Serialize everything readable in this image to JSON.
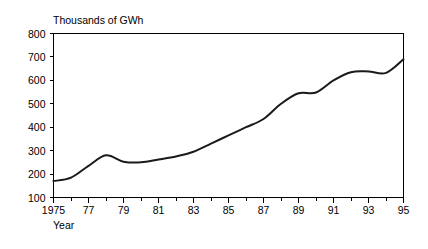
{
  "chart_data": {
    "type": "line",
    "title": "",
    "ylabel": "Thousands of GWh",
    "xlabel": "Year",
    "ylim": [
      100,
      800
    ],
    "xlim": [
      1975,
      1995
    ],
    "grid": false,
    "legend": null,
    "y_ticks": [
      100,
      200,
      300,
      400,
      500,
      600,
      700,
      800
    ],
    "y_tick_labels": [
      "100",
      "200",
      "300",
      "400",
      "500",
      "600",
      "700",
      "800"
    ],
    "x_ticks": [
      1975,
      1977,
      1979,
      1981,
      1983,
      1985,
      1987,
      1989,
      1991,
      1993,
      1995
    ],
    "x_tick_labels": [
      "1975",
      "77",
      "79",
      "81",
      "83",
      "85",
      "87",
      "89",
      "91",
      "93",
      "95"
    ],
    "x_minor_ticks": [
      1976,
      1978,
      1980,
      1982,
      1984,
      1986,
      1988,
      1990,
      1992,
      1994
    ],
    "series": [
      {
        "name": "Electricity generation",
        "color": "#1a1a1a",
        "x": [
          1975,
          1976,
          1977,
          1978,
          1979,
          1980,
          1981,
          1982,
          1983,
          1984,
          1985,
          1986,
          1987,
          1988,
          1989,
          1990,
          1991,
          1992,
          1993,
          1994,
          1995
        ],
        "values": [
          170,
          185,
          235,
          280,
          253,
          250,
          262,
          275,
          295,
          330,
          365,
          400,
          435,
          500,
          545,
          548,
          600,
          635,
          638,
          632,
          690
        ]
      }
    ]
  },
  "labels": {
    "y_axis_title": "Thousands of GWh",
    "x_axis_title": "Year"
  },
  "colors": {
    "line": "#1a1a1a",
    "axis": "#000000",
    "background": "#ffffff"
  }
}
